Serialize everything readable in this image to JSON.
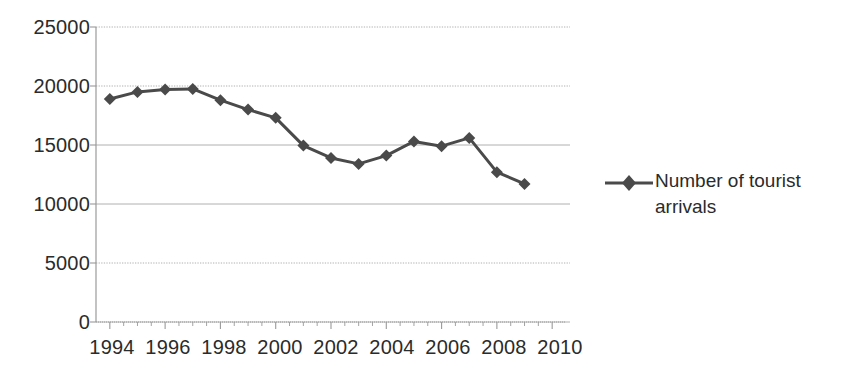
{
  "chart_data": {
    "type": "line",
    "title": "",
    "xlabel": "",
    "ylabel": "",
    "x": [
      1994,
      1995,
      1996,
      1997,
      1998,
      1999,
      2000,
      2001,
      2002,
      2003,
      2004,
      2005,
      2006,
      2007,
      2008,
      2009
    ],
    "series": [
      {
        "name": "Number of tourist arrivals",
        "values": [
          18900,
          19500,
          19700,
          19750,
          18800,
          18000,
          17300,
          14950,
          13900,
          13400,
          14100,
          15300,
          14900,
          15600,
          12700,
          11700
        ]
      }
    ],
    "xlim": [
      1993.5,
      2010.5
    ],
    "ylim": [
      0,
      25000
    ],
    "y_ticks": [
      0,
      5000,
      10000,
      15000,
      20000,
      25000
    ],
    "y_tick_labels": [
      "0",
      "5000",
      "10000",
      "15000",
      "20000",
      "25000"
    ],
    "x_ticks": [
      1994,
      1996,
      1998,
      2000,
      2002,
      2004,
      2006,
      2008,
      2010
    ],
    "x_tick_labels": [
      "1994",
      "1996",
      "1998",
      "2000",
      "2002",
      "2004",
      "2006",
      "2008",
      "2010"
    ],
    "grid": true,
    "grid_axis": "y",
    "legend_position": "right",
    "series_color": "#4a4a4a",
    "marker": "diamond",
    "gridline_color": "#b0b0b0",
    "axis_color": "#9a9a9a"
  },
  "legend": {
    "entries": [
      {
        "label": "Number of tourist arrivals",
        "marker": "diamond-line-marker"
      }
    ]
  },
  "y_axis": {
    "labels": [
      "25000",
      "20000",
      "15000",
      "10000",
      "5000",
      "0"
    ]
  },
  "x_axis": {
    "labels": [
      "1994",
      "1996",
      "1998",
      "2000",
      "2002",
      "2004",
      "2006",
      "2008",
      "2010"
    ]
  }
}
